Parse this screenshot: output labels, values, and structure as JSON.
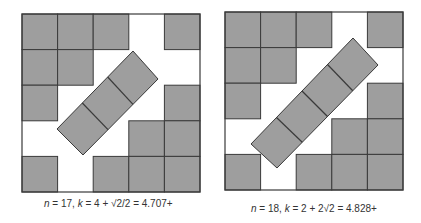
{
  "colors": {
    "fill": "#9e9e9e",
    "stroke": "#3a3a3a",
    "background": "#ffffff"
  },
  "diagrams": [
    {
      "n": 17,
      "caption": {
        "n_label": "n",
        "n_value": " = 17, ",
        "k_label": "k",
        "k_expr": " = 4 + √2/2 = 4.707+"
      },
      "frame": {
        "x": 22,
        "y": 14,
        "size": 178
      },
      "grid_cells": [
        [
          0,
          0
        ],
        [
          1,
          0
        ],
        [
          2,
          0
        ],
        [
          4,
          0
        ],
        [
          0,
          1
        ],
        [
          1,
          1
        ],
        [
          0,
          2
        ],
        [
          4,
          2
        ],
        [
          3,
          3
        ],
        [
          4,
          3
        ],
        [
          0,
          4
        ],
        [
          2,
          4
        ],
        [
          3,
          4
        ],
        [
          4,
          4
        ]
      ],
      "tilted_strip": {
        "squares": 3,
        "points": [
          [
            133,
            51
          ],
          [
            158,
            79
          ],
          [
            83,
            155
          ],
          [
            57,
            129
          ]
        ]
      }
    },
    {
      "n": 18,
      "caption": {
        "n_label": "n",
        "n_value": " = 18, ",
        "k_label": "k",
        "k_expr": " = 2 + 2√2 = 4.828+"
      },
      "frame": {
        "x": 225,
        "y": 12,
        "size": 178
      },
      "grid_cells": [
        [
          0,
          0
        ],
        [
          1,
          0
        ],
        [
          2,
          0
        ],
        [
          4,
          0
        ],
        [
          0,
          1
        ],
        [
          1,
          1
        ],
        [
          0,
          2
        ],
        [
          4,
          2
        ],
        [
          3,
          3
        ],
        [
          4,
          3
        ],
        [
          0,
          4
        ],
        [
          2,
          4
        ],
        [
          3,
          4
        ],
        [
          4,
          4
        ]
      ],
      "tilted_strip": {
        "squares": 4,
        "points": [
          [
            353,
            38
          ],
          [
            378,
            65
          ],
          [
            277,
            168
          ],
          [
            251,
            144
          ]
        ]
      }
    }
  ]
}
